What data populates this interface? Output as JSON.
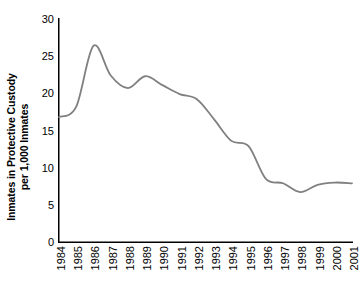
{
  "chart_data": {
    "type": "line",
    "title": "",
    "xlabel": "",
    "ylabel": "Inmates in Protective Custody per 1,000 Inmates",
    "ylabel_line1": "Inmates in Protective Custody",
    "ylabel_line2": "per 1,000 Inmates",
    "categories": [
      "1984",
      "1985",
      "1986",
      "1987",
      "1988",
      "1989",
      "1990",
      "1991",
      "1992",
      "1993",
      "1994",
      "1995",
      "1996",
      "1997",
      "1998",
      "1999",
      "2000",
      "2001"
    ],
    "values": [
      16.8,
      18.2,
      26.4,
      22.4,
      20.7,
      22.3,
      21.1,
      19.9,
      19.2,
      16.5,
      13.6,
      12.9,
      8.5,
      7.9,
      6.7,
      7.7,
      8.0,
      7.9
    ],
    "series": [
      {
        "name": "Inmates in Protective Custody per 1,000 Inmates",
        "values": [
          16.8,
          18.2,
          26.4,
          22.4,
          20.7,
          22.3,
          21.1,
          19.9,
          19.2,
          16.5,
          13.6,
          12.9,
          8.5,
          7.9,
          6.7,
          7.7,
          8.0,
          7.9
        ]
      }
    ],
    "ylim": [
      0,
      30
    ],
    "yticks": [
      0,
      5,
      10,
      15,
      20,
      25,
      30
    ],
    "ytick_labels": [
      "0",
      "5",
      "10",
      "15",
      "20",
      "25",
      "30"
    ],
    "xlim": [
      "1984",
      "2001"
    ],
    "grid": false,
    "legend": null,
    "line_color": "#808080",
    "axis_color": "#000000",
    "background_color": "#ffffff",
    "smoothing": "spline"
  }
}
